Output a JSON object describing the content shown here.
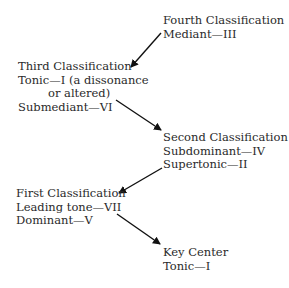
{
  "nodes": {
    "fourth": {
      "title": "Fourth Classification",
      "lines": [
        "Mediant—III"
      ]
    },
    "third": {
      "title": "Third Classification",
      "lines": [
        "Tonic—I (a dissonance",
        "or altered)",
        "Submediant—VI"
      ]
    },
    "second": {
      "title": "Second Classification",
      "lines": [
        "Subdominant—IV",
        "Supertonic—II"
      ]
    },
    "first": {
      "title": "First Classification",
      "lines": [
        "Leading tone—VII",
        "Dominant—V"
      ]
    },
    "key": {
      "title": "Key Center",
      "lines": [
        "Tonic—I"
      ]
    }
  },
  "edges": [
    {
      "from": "fourth",
      "to": "third"
    },
    {
      "from": "third",
      "to": "second"
    },
    {
      "from": "second",
      "to": "first"
    },
    {
      "from": "first",
      "to": "key"
    }
  ]
}
